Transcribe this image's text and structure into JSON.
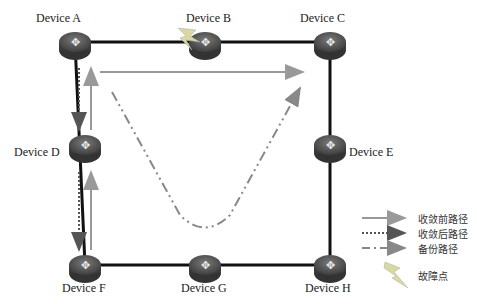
{
  "devices": [
    {
      "id": "A",
      "label": "Device A",
      "x": 75,
      "y": 42
    },
    {
      "id": "B",
      "label": "Device B",
      "x": 205,
      "y": 42
    },
    {
      "id": "C",
      "label": "Device C",
      "x": 330,
      "y": 42
    },
    {
      "id": "D",
      "label": "Device D",
      "x": 85,
      "y": 145
    },
    {
      "id": "E",
      "label": "Device E",
      "x": 330,
      "y": 145
    },
    {
      "id": "F",
      "label": "Device F",
      "x": 85,
      "y": 265
    },
    {
      "id": "G",
      "label": "Device G",
      "x": 205,
      "y": 265
    },
    {
      "id": "H",
      "label": "Device H",
      "x": 330,
      "y": 265
    }
  ],
  "fault_device": "B",
  "legend": {
    "pre_convergence": "收敛前路径",
    "post_convergence": "收敛后路径",
    "backup": "备份路径",
    "fault_point": "故障点"
  },
  "colors": {
    "link": "#111111",
    "pre": "#999999",
    "post": "#555555",
    "backup": "#888888",
    "fault": "#d8d8a0"
  }
}
